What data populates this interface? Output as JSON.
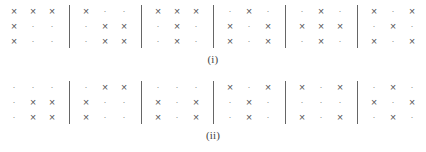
{
  "figure": {
    "mark_symbol": "×",
    "empty_symbol": "·",
    "mark_color": "#545454",
    "empty_color": "#8c8c8c",
    "divider_color": "#666666",
    "background_color": "#ffffff"
  },
  "panels": [
    {
      "label": "(i)",
      "grids": [
        {
          "rows": [
            [
              "x",
              "x",
              "x"
            ],
            [
              "x",
              ".",
              "."
            ],
            [
              "x",
              ".",
              "."
            ]
          ]
        },
        {
          "rows": [
            [
              "x",
              ".",
              "."
            ],
            [
              ".",
              "x",
              "x"
            ],
            [
              ".",
              "x",
              "x"
            ]
          ]
        },
        {
          "rows": [
            [
              "x",
              "x",
              "x"
            ],
            [
              ".",
              "x",
              "."
            ],
            [
              ".",
              "x",
              "."
            ]
          ]
        },
        {
          "rows": [
            [
              ".",
              "x",
              "."
            ],
            [
              "x",
              ".",
              "x"
            ],
            [
              "x",
              ".",
              "x"
            ]
          ]
        },
        {
          "rows": [
            [
              ".",
              "x",
              "."
            ],
            [
              "x",
              "x",
              "x"
            ],
            [
              ".",
              "x",
              "."
            ]
          ]
        },
        {
          "rows": [
            [
              "x",
              ".",
              "x"
            ],
            [
              ".",
              "x",
              "."
            ],
            [
              "x",
              ".",
              "x"
            ]
          ]
        }
      ]
    },
    {
      "label": "(ii)",
      "grids": [
        {
          "rows": [
            [
              ".",
              ".",
              "."
            ],
            [
              ".",
              "x",
              "x"
            ],
            [
              ".",
              "x",
              "x"
            ]
          ]
        },
        {
          "rows": [
            [
              ".",
              "x",
              "x"
            ],
            [
              "x",
              ".",
              "."
            ],
            [
              "x",
              ".",
              "."
            ]
          ]
        },
        {
          "rows": [
            [
              ".",
              ".",
              "."
            ],
            [
              "x",
              ".",
              "x"
            ],
            [
              "x",
              ".",
              "x"
            ]
          ]
        },
        {
          "rows": [
            [
              "x",
              ".",
              "x"
            ],
            [
              ".",
              "x",
              "."
            ],
            [
              ".",
              "x",
              "."
            ]
          ]
        },
        {
          "rows": [
            [
              "x",
              ".",
              "x"
            ],
            [
              ".",
              ".",
              "."
            ],
            [
              "x",
              ".",
              "x"
            ]
          ]
        },
        {
          "rows": [
            [
              ".",
              "x",
              "."
            ],
            [
              "x",
              ".",
              "x"
            ],
            [
              ".",
              "x",
              "."
            ]
          ]
        }
      ]
    }
  ]
}
